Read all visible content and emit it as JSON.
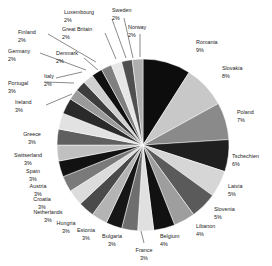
{
  "chart_data": {
    "type": "pie",
    "title": "",
    "subtitle": "",
    "xlabel": "",
    "ylabel": "",
    "legend_position": "none",
    "grid": false,
    "value_unit": "%",
    "start_angle_deg": 0,
    "direction": "clockwise",
    "labels": [
      "Romania",
      "Slovakia",
      "Poland",
      "Tschechien",
      "Latvia",
      "Slovenia",
      "Libanon",
      "Belgium",
      "France",
      "Bulgaria",
      "Estonia",
      "Hungria",
      "Netherlands",
      "Croatia",
      "Austria",
      "Spain",
      "Switserland",
      "Greece",
      "Ireland",
      "Portugal",
      "Italy",
      "Denmark",
      "Germany",
      "Finland",
      "Great Britain",
      "Luxembourg",
      "Sweden",
      "Norway"
    ],
    "values": [
      9,
      8,
      7,
      6,
      5,
      5,
      4,
      4,
      3,
      3,
      3,
      3,
      3,
      3,
      3,
      3,
      3,
      3,
      3,
      3,
      2,
      2,
      2,
      2,
      2,
      2,
      2,
      2
    ],
    "slice_colors": [
      "#0d0d0d",
      "#c8c8c8",
      "#8a8a8a",
      "#1f1f1f",
      "#d6d6d6",
      "#5a5a5a",
      "#9e9e9e",
      "#111111",
      "#e0e0e0",
      "#6e6e6e",
      "#161616",
      "#b4b4b4",
      "#4a4a4a",
      "#dcdcdc",
      "#7a7a7a",
      "#121212",
      "#c0c0c0",
      "#5f5f5f",
      "#e2e2e2",
      "#2a2a2a",
      "#9a9a9a",
      "#3d3d3d",
      "#d0d0d0",
      "#101010",
      "#808080",
      "#e6e6e6",
      "#4f4f4f",
      "#aeaeae"
    ],
    "slices": [
      {
        "label": "Romania",
        "value": 9,
        "pct_text": "9%",
        "color": "#0d0d0d"
      },
      {
        "label": "Slovakia",
        "value": 8,
        "pct_text": "8%",
        "color": "#c8c8c8"
      },
      {
        "label": "Poland",
        "value": 7,
        "pct_text": "7%",
        "color": "#8a8a8a"
      },
      {
        "label": "Tschechien",
        "value": 6,
        "pct_text": "6%",
        "color": "#1f1f1f"
      },
      {
        "label": "Latvia",
        "value": 5,
        "pct_text": "5%",
        "color": "#d6d6d6"
      },
      {
        "label": "Slovenia",
        "value": 5,
        "pct_text": "5%",
        "color": "#5a5a5a"
      },
      {
        "label": "Libanon",
        "value": 4,
        "pct_text": "4%",
        "color": "#9e9e9e"
      },
      {
        "label": "Belgium",
        "value": 4,
        "pct_text": "4%",
        "color": "#111111"
      },
      {
        "label": "France",
        "value": 3,
        "pct_text": "3%",
        "color": "#e0e0e0"
      },
      {
        "label": "Bulgaria",
        "value": 3,
        "pct_text": "3%",
        "color": "#6e6e6e"
      },
      {
        "label": "Estonia",
        "value": 3,
        "pct_text": "3%",
        "color": "#161616"
      },
      {
        "label": "Hungria",
        "value": 3,
        "pct_text": "3%",
        "color": "#b4b4b4"
      },
      {
        "label": "Netherlands",
        "value": 3,
        "pct_text": "3%",
        "color": "#4a4a4a"
      },
      {
        "label": "Croatia",
        "value": 3,
        "pct_text": "3%",
        "color": "#dcdcdc"
      },
      {
        "label": "Austria",
        "value": 3,
        "pct_text": "3%",
        "color": "#7a7a7a"
      },
      {
        "label": "Spain",
        "value": 3,
        "pct_text": "3%",
        "color": "#121212"
      },
      {
        "label": "Switserland",
        "value": 3,
        "pct_text": "3%",
        "color": "#c0c0c0"
      },
      {
        "label": "Greece",
        "value": 3,
        "pct_text": "3%",
        "color": "#5f5f5f"
      },
      {
        "label": "Ireland",
        "value": 3,
        "pct_text": "3%",
        "color": "#e2e2e2"
      },
      {
        "label": "Portugal",
        "value": 3,
        "pct_text": "3%",
        "color": "#2a2a2a"
      },
      {
        "label": "Italy",
        "value": 2,
        "pct_text": "2%",
        "color": "#9a9a9a"
      },
      {
        "label": "Denmark",
        "value": 2,
        "pct_text": "2%",
        "color": "#3d3d3d"
      },
      {
        "label": "Germany",
        "value": 2,
        "pct_text": "2%",
        "color": "#d0d0d0"
      },
      {
        "label": "Finland",
        "value": 2,
        "pct_text": "2%",
        "color": "#101010"
      },
      {
        "label": "Great Britain",
        "value": 2,
        "pct_text": "2%",
        "color": "#808080"
      },
      {
        "label": "Luxembourg",
        "value": 2,
        "pct_text": "2%",
        "color": "#e6e6e6"
      },
      {
        "label": "Sweden",
        "value": 2,
        "pct_text": "2%",
        "color": "#4f4f4f"
      },
      {
        "label": "Norway",
        "value": 2,
        "pct_text": "2%",
        "color": "#aeaeae"
      }
    ]
  },
  "geometry": {
    "center_x": 143,
    "center_y": 145,
    "radius": 86
  },
  "label_layout": [
    {
      "label": "Romania",
      "tx": 196,
      "ty": 44,
      "anchor": "start",
      "leader": false
    },
    {
      "label": "Slovakia",
      "tx": 222,
      "ty": 70,
      "anchor": "start",
      "leader": false
    },
    {
      "label": "Poland",
      "tx": 237,
      "ty": 114,
      "anchor": "start",
      "leader": false
    },
    {
      "label": "Tschechien",
      "tx": 232,
      "ty": 158,
      "anchor": "start",
      "leader": false
    },
    {
      "label": "Latvia",
      "tx": 228,
      "ty": 188,
      "anchor": "start",
      "leader": false
    },
    {
      "label": "Slovenia",
      "tx": 214,
      "ty": 211,
      "anchor": "start",
      "leader": false
    },
    {
      "label": "Libanon",
      "tx": 196,
      "ty": 228,
      "anchor": "start",
      "leader": false
    },
    {
      "label": "Belgium",
      "tx": 160,
      "ty": 238,
      "anchor": "start",
      "leader": false
    },
    {
      "label": "France",
      "tx": 144,
      "ty": 252,
      "anchor": "middle",
      "leader": true,
      "lx1": 144,
      "ly1": 243,
      "lx2": 141,
      "ly2": 231
    },
    {
      "label": "Bulgaria",
      "tx": 112,
      "ty": 238,
      "anchor": "middle",
      "leader": false
    },
    {
      "label": "Estonia",
      "tx": 86,
      "ty": 232,
      "anchor": "middle",
      "leader": false
    },
    {
      "label": "Hungria",
      "tx": 66,
      "ty": 225,
      "anchor": "middle",
      "leader": false
    },
    {
      "label": "Netherlands",
      "tx": 48,
      "ty": 214,
      "anchor": "middle",
      "leader": false
    },
    {
      "label": "Croatia",
      "tx": 42,
      "ty": 201,
      "anchor": "middle",
      "leader": false
    },
    {
      "label": "Austria",
      "tx": 38,
      "ty": 188,
      "anchor": "middle",
      "leader": false
    },
    {
      "label": "Spain",
      "tx": 33,
      "ty": 173,
      "anchor": "middle",
      "leader": false
    },
    {
      "label": "Switserland",
      "tx": 28,
      "ty": 157,
      "anchor": "middle",
      "leader": false
    },
    {
      "label": "Greece",
      "tx": 32,
      "ty": 136,
      "anchor": "middle",
      "leader": false
    },
    {
      "label": "Ireland",
      "tx": 15,
      "ty": 104,
      "anchor": "start",
      "leader": true,
      "lx1": 46,
      "ly1": 105,
      "lx2": 72,
      "ly2": 94
    },
    {
      "label": "Portugal",
      "tx": 8,
      "ty": 85,
      "anchor": "start",
      "leader": true,
      "lx1": 44,
      "ly1": 82,
      "lx2": 74,
      "ly2": 83
    },
    {
      "label": "Italy",
      "tx": 44,
      "ty": 78,
      "anchor": "start",
      "leader": true,
      "lx1": 56,
      "ly1": 78,
      "lx2": 82,
      "ly2": 72
    },
    {
      "label": "Denmark",
      "tx": 56,
      "ty": 55,
      "anchor": "start",
      "leader": true,
      "lx1": 84,
      "ly1": 58,
      "lx2": 98,
      "ly2": 70
    },
    {
      "label": "Germany",
      "tx": 8,
      "ty": 53,
      "anchor": "start",
      "leader": true,
      "lx1": 40,
      "ly1": 53,
      "lx2": 86,
      "ly2": 70
    },
    {
      "label": "Finland",
      "tx": 18,
      "ty": 34,
      "anchor": "start",
      "leader": true,
      "lx1": 48,
      "ly1": 34,
      "lx2": 96,
      "ly2": 62
    },
    {
      "label": "Great Britain",
      "tx": 62,
      "ty": 31,
      "anchor": "start",
      "leader": true,
      "lx1": 105,
      "ly1": 33,
      "lx2": 116,
      "ly2": 59
    },
    {
      "label": "Luxembourg",
      "tx": 64,
      "ty": 14,
      "anchor": "start",
      "leader": true,
      "lx1": 112,
      "ly1": 19,
      "lx2": 126,
      "ly2": 58
    },
    {
      "label": "Sweden",
      "tx": 112,
      "ty": 12,
      "anchor": "start",
      "leader": true,
      "lx1": 124,
      "ly1": 18,
      "lx2": 133,
      "ly2": 58
    },
    {
      "label": "Norway",
      "tx": 128,
      "ty": 29,
      "anchor": "start",
      "leader": true,
      "lx1": 140,
      "ly1": 34,
      "lx2": 140,
      "ly2": 57
    }
  ]
}
